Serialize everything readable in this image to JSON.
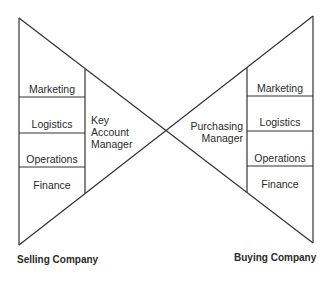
{
  "diagram": {
    "type": "bow-tie relationship model",
    "line_color": "#333333",
    "selling": {
      "title": "Selling Company",
      "departments": [
        "Marketing",
        "Logistics",
        "Operations",
        "Finance"
      ],
      "contact": {
        "line1": "Key",
        "line2": "Account",
        "line3": "Manager"
      }
    },
    "buying": {
      "title": "Buying Company",
      "departments": [
        "Marketing",
        "Logistics",
        "Operations",
        "Finance"
      ],
      "contact": {
        "line1": "Purchasing",
        "line2": "Manager"
      }
    }
  }
}
